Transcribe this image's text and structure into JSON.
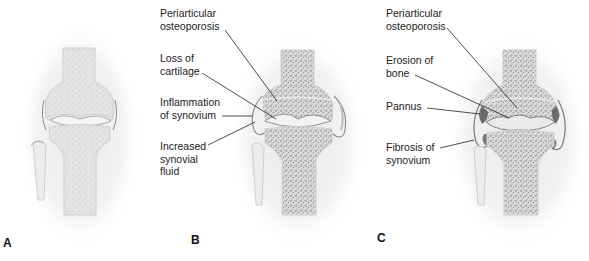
{
  "figure": {
    "panels": [
      {
        "id": "A",
        "letter": "A",
        "description": "Normal knee joint",
        "labels": []
      },
      {
        "id": "B",
        "letter": "B",
        "labels": [
          {
            "text": "Periarticular\nosteoporosis"
          },
          {
            "text": "Loss of\ncartilage"
          },
          {
            "text": "Inflammation\nof synovium"
          },
          {
            "text": "Increased\nsynovial\nfluid"
          }
        ]
      },
      {
        "id": "C",
        "letter": "C",
        "labels": [
          {
            "text": "Periarticular\nosteoporosis"
          },
          {
            "text": "Erosion of\nbone"
          },
          {
            "text": "Pannus"
          },
          {
            "text": "Fibrosis of\nsynovium"
          }
        ]
      }
    ]
  },
  "colors": {
    "background": "#ffffff",
    "bone_fill": "#e6e6e6",
    "bone_outline": "#cfcfcf",
    "bone_speckle": "#8a8a8a",
    "soft_tissue": "#ececec",
    "leader_line": "#222222",
    "text": "#222222",
    "pannus": "#4a4a4a"
  }
}
